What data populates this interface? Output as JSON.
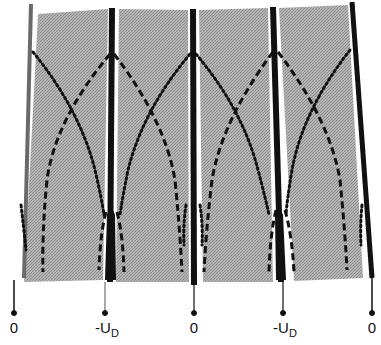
{
  "diagram": {
    "type": "electrode potential field diagram",
    "colors": {
      "panel_fill": "#a9a9a9",
      "electrode": "#111111",
      "electrode_left": "#666666",
      "background": "#ffffff",
      "curve": "#111111"
    },
    "electrodes": [
      {
        "id": "e0",
        "label_main": "0",
        "label_sub": "",
        "x_top": 31,
        "x_bottom": 26,
        "label_x": 14,
        "width": 4
      },
      {
        "id": "e1",
        "label_main": "-U",
        "label_sub": "D",
        "x_top": 112,
        "x_bottom": 107,
        "label_x": 103,
        "width": 6
      },
      {
        "id": "e2",
        "label_main": "0",
        "label_sub": "",
        "x_top": 193,
        "x_bottom": 194,
        "label_x": 194,
        "width": 6
      },
      {
        "id": "e3",
        "label_main": "-U",
        "label_sub": "D",
        "x_top": 273,
        "x_bottom": 285,
        "label_x": 283,
        "width": 6
      },
      {
        "id": "e4",
        "label_main": "0",
        "label_sub": "",
        "x_top": 353,
        "x_bottom": 372,
        "label_x": 372,
        "width": 5
      }
    ],
    "labels": [
      {
        "text": "0",
        "sub": ""
      },
      {
        "text": "-U",
        "sub": "D"
      },
      {
        "text": "0",
        "sub": ""
      },
      {
        "text": "-U",
        "sub": "D"
      },
      {
        "text": "0",
        "sub": ""
      }
    ],
    "legend": {
      "dashed_curve": "field line from -U_D electrode",
      "dotted_curve": "field line from 0 electrode"
    }
  }
}
